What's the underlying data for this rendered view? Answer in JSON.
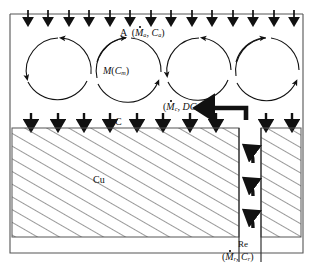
{
  "figure": {
    "type": "schematic-diagram",
    "title": "",
    "background_color": "#ffffff",
    "line_color": "#111111",
    "frame": {
      "x": 10,
      "y": 14,
      "width": 293,
      "height": 239
    }
  },
  "labels": {
    "inflow": {
      "text": "A",
      "symbol_m": "M",
      "symbol_c": "C",
      "sub_m": "a",
      "sub_c": "a",
      "open": "(",
      "comma": ", ",
      "close": ")"
    },
    "melt": {
      "symbol_m": "M",
      "open": "(",
      "symbol_c": "C",
      "sub_c": "m",
      "close": ")"
    },
    "crystal_flow": {
      "open": "(",
      "symbol_m": "M",
      "sub_m": "c",
      "comma": ", ",
      "symbol_d": "D",
      "symbol_c": "C",
      "sub_c": "m",
      "close": ")"
    },
    "concentration": {
      "text": "C"
    },
    "substrate": {
      "text": "Cu"
    },
    "return_channel": {
      "text": "Re"
    },
    "return_flow": {
      "open": "(",
      "symbol_m": "M",
      "sub_m": "r",
      "comma": ", ",
      "symbol_c": "C",
      "sub_c": "r",
      "close": ")"
    }
  },
  "vortices": [
    {
      "id": "cell-1",
      "cx": 58,
      "cy": 71,
      "r": 33,
      "direction": "counter-clockwise"
    },
    {
      "id": "cell-2",
      "cx": 129,
      "cy": 71,
      "r": 33,
      "direction": "clockwise"
    },
    {
      "id": "cell-3",
      "cx": 199,
      "cy": 71,
      "r": 33,
      "direction": "counter-clockwise"
    },
    {
      "id": "cell-4",
      "cx": 268,
      "cy": 71,
      "r": 33,
      "direction": "clockwise"
    }
  ],
  "arrow_rows": {
    "top": {
      "y": 14,
      "count": 14,
      "direction": "down",
      "x_start": 18,
      "x_end": 297
    },
    "middle": {
      "y": 120,
      "count": 11,
      "direction": "down",
      "x_start": 31,
      "x_end": 292
    }
  },
  "channel": {
    "x_left": 239,
    "x_right": 261,
    "y_top": 128,
    "y_bottom": 262,
    "arrows": [
      {
        "y": 150
      },
      {
        "y": 180
      },
      {
        "y": 212
      }
    ],
    "direction": "up"
  },
  "feed_arrow": {
    "x_tail": 246,
    "x_head": 197,
    "y": 108,
    "direction": "left",
    "style": "thick"
  },
  "hatched_block": {
    "x": 12,
    "y": 128,
    "width": 289,
    "height": 109,
    "pattern": "diagonal-hatch",
    "angle_deg": 60
  }
}
